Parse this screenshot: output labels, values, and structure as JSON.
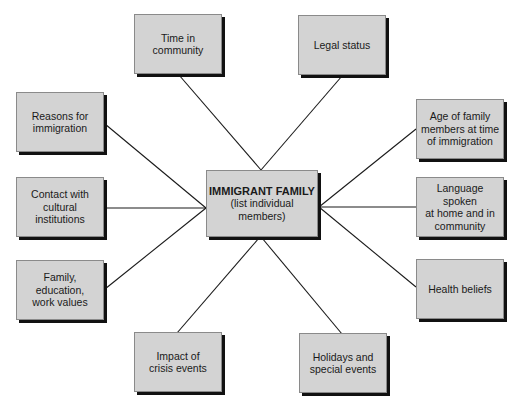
{
  "diagram": {
    "type": "hub-and-spoke",
    "colors": {
      "box_fill": "#d3d3d3",
      "box_border": "#8a8a8a",
      "shadow": "#111111",
      "line": "#1a1a1a",
      "background": "#ffffff"
    },
    "center": {
      "title": "IMMIGRANT FAMILY",
      "subtitle_line1": "(list individual",
      "subtitle_line2": "members)"
    },
    "nodes": {
      "time_in_community": {
        "lines": [
          "Time in",
          "community"
        ]
      },
      "legal_status": {
        "lines": [
          "Legal status"
        ]
      },
      "reasons_for_immigration": {
        "lines": [
          "Reasons for",
          "immigration"
        ]
      },
      "age_of_family_members": {
        "lines": [
          "Age of family",
          "members at time",
          "of immigration"
        ]
      },
      "contact_cultural_institutions": {
        "lines": [
          "Contact with",
          "cultural",
          "institutions"
        ]
      },
      "language_spoken": {
        "lines": [
          "Language spoken",
          "at home and in",
          "community"
        ]
      },
      "family_education_work_values": {
        "lines": [
          "Family, education,",
          "work values"
        ]
      },
      "health_beliefs": {
        "lines": [
          "Health beliefs"
        ]
      },
      "impact_of_crisis_events": {
        "lines": [
          "Impact of",
          "crisis events"
        ]
      },
      "holidays_special_events": {
        "lines": [
          "Holidays and",
          "special events"
        ]
      }
    },
    "edges": [
      {
        "from": "IMMIGRANT FAMILY",
        "to": "Time in community"
      },
      {
        "from": "IMMIGRANT FAMILY",
        "to": "Legal status"
      },
      {
        "from": "IMMIGRANT FAMILY",
        "to": "Reasons for immigration"
      },
      {
        "from": "IMMIGRANT FAMILY",
        "to": "Age of family members at time of immigration"
      },
      {
        "from": "IMMIGRANT FAMILY",
        "to": "Contact with cultural institutions"
      },
      {
        "from": "IMMIGRANT FAMILY",
        "to": "Language spoken at home and in community"
      },
      {
        "from": "IMMIGRANT FAMILY",
        "to": "Family, education, work values"
      },
      {
        "from": "IMMIGRANT FAMILY",
        "to": "Health beliefs"
      },
      {
        "from": "IMMIGRANT FAMILY",
        "to": "Impact of crisis events"
      },
      {
        "from": "IMMIGRANT FAMILY",
        "to": "Holidays and special events"
      }
    ]
  }
}
